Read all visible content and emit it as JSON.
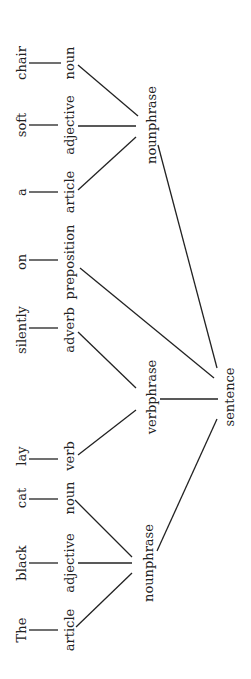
{
  "diagram": {
    "type": "parse-tree",
    "orientation": "rotated-90-ccw",
    "words": [
      {
        "id": "w_chair",
        "text": "chair",
        "x": 21,
        "y": 63
      },
      {
        "id": "w_soft",
        "text": "soft",
        "x": 21,
        "y": 125
      },
      {
        "id": "w_a",
        "text": "a",
        "x": 21,
        "y": 192
      },
      {
        "id": "w_on",
        "text": "on",
        "x": 21,
        "y": 262
      },
      {
        "id": "w_silently",
        "text": "silently",
        "x": 21,
        "y": 330
      },
      {
        "id": "w_lay",
        "text": "lay",
        "x": 21,
        "y": 456
      },
      {
        "id": "w_cat",
        "text": "cat",
        "x": 21,
        "y": 498
      },
      {
        "id": "w_black",
        "text": "black",
        "x": 21,
        "y": 563
      },
      {
        "id": "w_the",
        "text": "The",
        "x": 21,
        "y": 630
      }
    ],
    "pos": [
      {
        "id": "p_noun1",
        "text": "noun",
        "x": 69,
        "y": 63
      },
      {
        "id": "p_adj1",
        "text": "adjective",
        "x": 69,
        "y": 125
      },
      {
        "id": "p_art1",
        "text": "article",
        "x": 69,
        "y": 192
      },
      {
        "id": "p_prep",
        "text": "preposition",
        "x": 69,
        "y": 262
      },
      {
        "id": "p_adv",
        "text": "adverb",
        "x": 69,
        "y": 330
      },
      {
        "id": "p_verb",
        "text": "verb",
        "x": 69,
        "y": 456
      },
      {
        "id": "p_noun2",
        "text": "noun",
        "x": 69,
        "y": 498
      },
      {
        "id": "p_adj2",
        "text": "adjective",
        "x": 69,
        "y": 563
      },
      {
        "id": "p_art2",
        "text": "article",
        "x": 69,
        "y": 630
      }
    ],
    "phrases": [
      {
        "id": "np_top",
        "text": "nounphrase",
        "x": 151,
        "y": 125
      },
      {
        "id": "vp",
        "text": "verbphrase",
        "x": 151,
        "y": 397
      },
      {
        "id": "np_bottom",
        "text": "nounphrase",
        "x": 148,
        "y": 563
      },
      {
        "id": "s",
        "text": "sentence",
        "x": 229,
        "y": 397
      }
    ],
    "edges": [
      {
        "x1": 29,
        "y1": 63,
        "x2": 61,
        "y2": 63
      },
      {
        "x1": 29,
        "y1": 125,
        "x2": 58,
        "y2": 125
      },
      {
        "x1": 29,
        "y1": 192,
        "x2": 58,
        "y2": 192
      },
      {
        "x1": 29,
        "y1": 260,
        "x2": 58,
        "y2": 260
      },
      {
        "x1": 29,
        "y1": 328,
        "x2": 58,
        "y2": 328
      },
      {
        "x1": 29,
        "y1": 459,
        "x2": 58,
        "y2": 459
      },
      {
        "x1": 29,
        "y1": 499,
        "x2": 58,
        "y2": 499
      },
      {
        "x1": 29,
        "y1": 563,
        "x2": 58,
        "y2": 563
      },
      {
        "x1": 29,
        "y1": 630,
        "x2": 58,
        "y2": 630
      },
      {
        "x1": 78,
        "y1": 65,
        "x2": 138,
        "y2": 116
      },
      {
        "x1": 78,
        "y1": 126,
        "x2": 136,
        "y2": 126
      },
      {
        "x1": 78,
        "y1": 190,
        "x2": 136,
        "y2": 137
      },
      {
        "x1": 78,
        "y1": 332,
        "x2": 136,
        "y2": 388
      },
      {
        "x1": 78,
        "y1": 455,
        "x2": 136,
        "y2": 410
      },
      {
        "x1": 80,
        "y1": 268,
        "x2": 214,
        "y2": 378
      },
      {
        "x1": 158,
        "y1": 145,
        "x2": 217,
        "y2": 368
      },
      {
        "x1": 160,
        "y1": 399,
        "x2": 218,
        "y2": 399
      },
      {
        "x1": 75,
        "y1": 500,
        "x2": 132,
        "y2": 557
      },
      {
        "x1": 78,
        "y1": 563,
        "x2": 132,
        "y2": 563
      },
      {
        "x1": 76,
        "y1": 627,
        "x2": 132,
        "y2": 573
      },
      {
        "x1": 157,
        "y1": 551,
        "x2": 217,
        "y2": 419
      }
    ]
  }
}
